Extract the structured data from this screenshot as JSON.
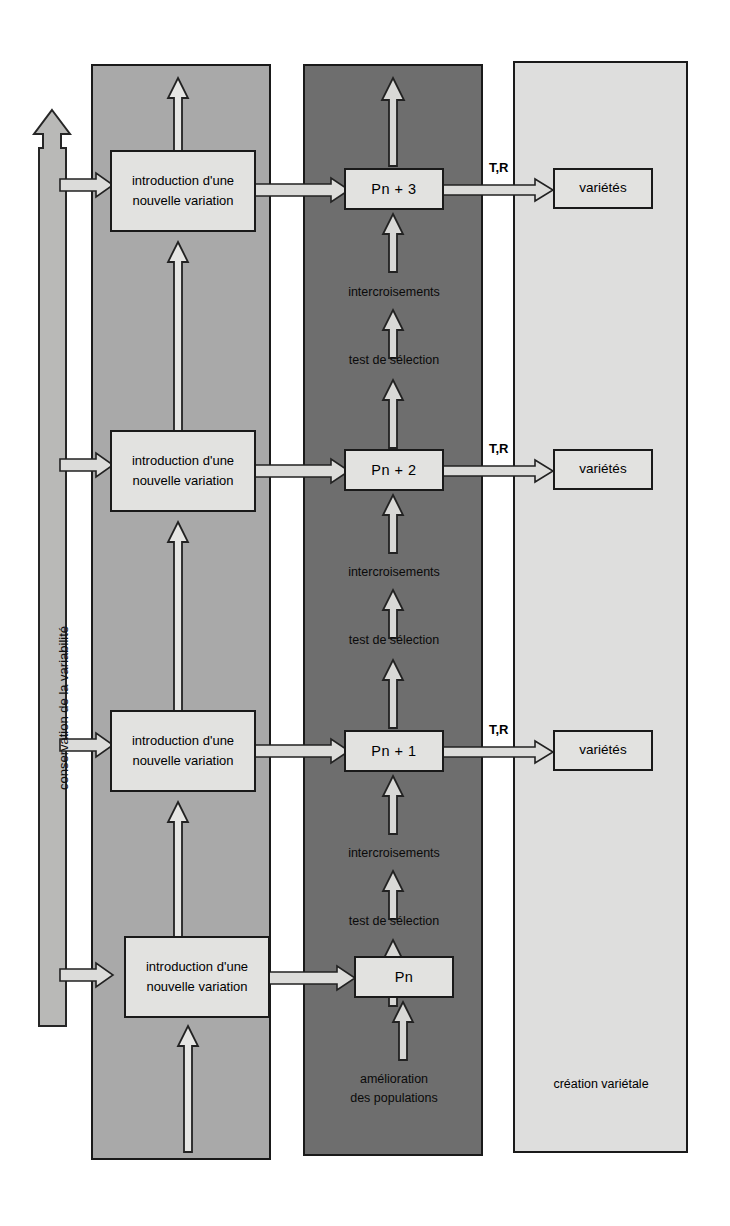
{
  "figure": {
    "columns": [
      {
        "name": "conservation",
        "label": "conservation de la variabilité",
        "color": "#a9a9a9"
      },
      {
        "name": "introduction",
        "label": "",
        "color": "#a9a9a9"
      },
      {
        "name": "amelioration",
        "label": "amélioration\ndes populations",
        "color": "#6e6e6e"
      },
      {
        "name": "creation",
        "label": "création variétale",
        "color": "#dededd"
      }
    ],
    "colors": {
      "column_grey": "#a9a9a9",
      "column_dark": "#6e6e6e",
      "column_light": "#dededd",
      "box_fill": "#e2e2e0",
      "outline": "#1a1a1a",
      "arrow_fill": "#cfcfcd"
    }
  },
  "left_axis": {
    "label": "conservation de la variabilité",
    "direction": "up"
  },
  "cycles": [
    {
      "id": "cycle-4",
      "introduction_box": "introduction\nd'une\nnouvelle variation",
      "population_box": "Pn + 3",
      "variety_box": "variétés",
      "transfer_label": "T,R",
      "step_crossing": "intercroisements",
      "step_selection": "test de sélection"
    },
    {
      "id": "cycle-3",
      "introduction_box": "introduction\nd'une\nnouvelle variation",
      "population_box": "Pn + 2",
      "variety_box": "variétés",
      "transfer_label": "T,R",
      "step_crossing": "intercroisements",
      "step_selection": "test de sélection"
    },
    {
      "id": "cycle-2",
      "introduction_box": "introduction\nd'une\nnouvelle variation",
      "population_box": "Pn + 1",
      "variety_box": "variétés",
      "transfer_label": "T,R",
      "step_crossing": "intercroisements",
      "step_selection": "test de sélection"
    },
    {
      "id": "cycle-1",
      "introduction_box": "introduction\nd'une\nnouvelle variation",
      "population_box": "Pn",
      "variety_box": "",
      "transfer_label": "",
      "step_crossing": "",
      "step_selection": "test de sélection"
    }
  ],
  "footers": {
    "amelioration": "amélioration\ndes populations",
    "creation": "création variétale"
  }
}
